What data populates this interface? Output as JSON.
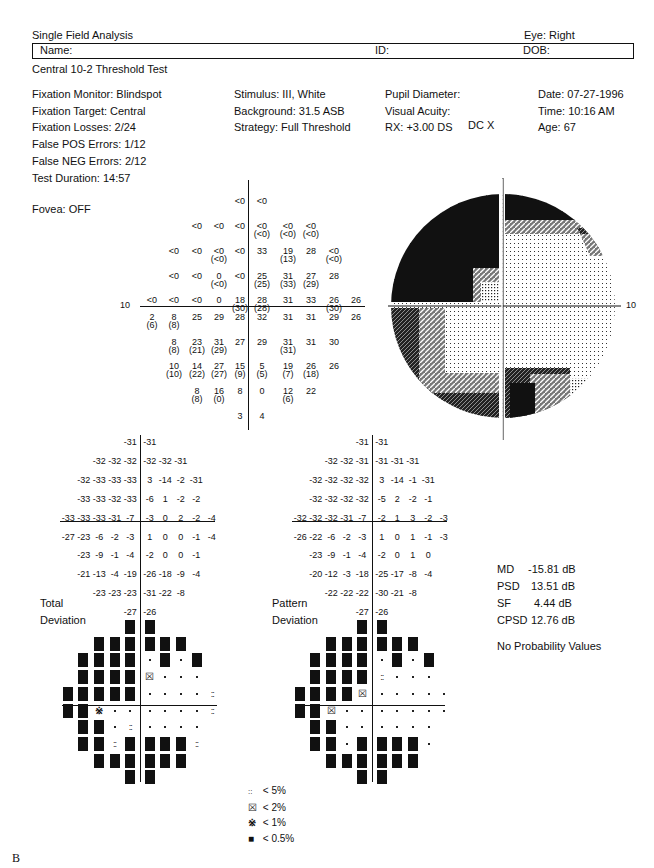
{
  "header": {
    "title": "Single Field Analysis",
    "eye": "Eye: Right",
    "name_label": "Name:",
    "id_label": "ID:",
    "dob_label": "DOB:",
    "test_name": "Central 10-2 Threshold Test"
  },
  "info": {
    "col1": [
      "Fixation Monitor: Blindspot",
      "Fixation Target: Central",
      "Fixation Losses: 2/24",
      "False POS Errors: 1/12",
      "False NEG Errors: 2/12",
      "Test Duration: 14:57"
    ],
    "fovea": "Fovea: OFF",
    "col2": [
      "Stimulus: III, White",
      "Background: 31.5 ASB",
      "Strategy: Full Threshold"
    ],
    "col3": [
      "Pupil Diameter:",
      "Visual Acuity:",
      "RX: +3.00 DS"
    ],
    "dc": "DC  X",
    "col4": [
      "Date: 07-27-1996",
      "Time: 10:16 AM",
      "Age: 67"
    ]
  },
  "axis_label": "10",
  "chart_data": [
    {
      "type": "table",
      "title": "Threshold values (dB), repeat in parentheses",
      "grid_columns": [
        -5,
        -4,
        -3,
        -2,
        -1,
        0,
        1,
        2,
        3,
        4
      ],
      "rows": [
        {
          "row": 1,
          "cells": [
            {
              "c": -1,
              "v": "<0"
            },
            {
              "c": 0,
              "v": "<0"
            }
          ]
        },
        {
          "row": 2,
          "cells": [
            {
              "c": -3,
              "v": "<0"
            },
            {
              "c": -2,
              "v": "<0"
            },
            {
              "c": -1,
              "v": "<0"
            },
            {
              "c": 0,
              "v": "<0",
              "r": "(<0)"
            },
            {
              "c": 1,
              "v": "<0",
              "r": "(<0)"
            },
            {
              "c": 2,
              "v": "<0",
              "r": "(<0)"
            }
          ]
        },
        {
          "row": 3,
          "cells": [
            {
              "c": -4,
              "v": "<0"
            },
            {
              "c": -3,
              "v": "<0"
            },
            {
              "c": -2,
              "v": "<0",
              "r": "(<0)"
            },
            {
              "c": -1,
              "v": "<0"
            },
            {
              "c": 0,
              "v": "33"
            },
            {
              "c": 1,
              "v": "19",
              "r": "(13)"
            },
            {
              "c": 2,
              "v": "28"
            },
            {
              "c": 3,
              "v": "<0",
              "r": "(<0)"
            }
          ]
        },
        {
          "row": 4,
          "cells": [
            {
              "c": -4,
              "v": "<0"
            },
            {
              "c": -3,
              "v": "<0"
            },
            {
              "c": -2,
              "v": "0",
              "r": "(<0)"
            },
            {
              "c": -1,
              "v": "<0"
            },
            {
              "c": 0,
              "v": "25",
              "r": "(25)"
            },
            {
              "c": 1,
              "v": "31",
              "r": "(33)"
            },
            {
              "c": 2,
              "v": "27",
              "r": "(29)"
            },
            {
              "c": 3,
              "v": "28"
            }
          ]
        },
        {
          "row": 5,
          "cells": [
            {
              "c": -5,
              "v": "<0"
            },
            {
              "c": -4,
              "v": "<0"
            },
            {
              "c": -3,
              "v": "<0"
            },
            {
              "c": -2,
              "v": "0"
            },
            {
              "c": -1,
              "v": "18",
              "r": "(30)"
            },
            {
              "c": 0,
              "v": "28",
              "r": "(28)"
            },
            {
              "c": 1,
              "v": "31"
            },
            {
              "c": 2,
              "v": "33"
            },
            {
              "c": 3,
              "v": "26",
              "r": "(30)"
            },
            {
              "c": 4,
              "v": "26"
            }
          ]
        },
        {
          "row": 6,
          "cells": [
            {
              "c": -5,
              "v": "2",
              "r": "(6)"
            },
            {
              "c": -4,
              "v": "8",
              "r": "(8)"
            },
            {
              "c": -3,
              "v": "25"
            },
            {
              "c": -2,
              "v": "29"
            },
            {
              "c": -1,
              "v": "28"
            },
            {
              "c": 0,
              "v": "32"
            },
            {
              "c": 1,
              "v": "31"
            },
            {
              "c": 2,
              "v": "31"
            },
            {
              "c": 3,
              "v": "29"
            },
            {
              "c": 4,
              "v": "26"
            }
          ]
        },
        {
          "row": 7,
          "cells": [
            {
              "c": -4,
              "v": "8",
              "r": "(8)"
            },
            {
              "c": -3,
              "v": "23",
              "r": "(21)"
            },
            {
              "c": -2,
              "v": "31",
              "r": "(29)"
            },
            {
              "c": -1,
              "v": "27"
            },
            {
              "c": 0,
              "v": "29"
            },
            {
              "c": 1,
              "v": "31",
              "r": "(31)"
            },
            {
              "c": 2,
              "v": "31"
            },
            {
              "c": 3,
              "v": "30"
            }
          ]
        },
        {
          "row": 8,
          "cells": [
            {
              "c": -4,
              "v": "10",
              "r": "(10)"
            },
            {
              "c": -3,
              "v": "14",
              "r": "(22)"
            },
            {
              "c": -2,
              "v": "27",
              "r": "(27)"
            },
            {
              "c": -1,
              "v": "15",
              "r": "(9)"
            },
            {
              "c": 0,
              "v": "5",
              "r": "(5)"
            },
            {
              "c": 1,
              "v": "19",
              "r": "(7)"
            },
            {
              "c": 2,
              "v": "26",
              "r": "(18)"
            },
            {
              "c": 3,
              "v": "26"
            }
          ]
        },
        {
          "row": 9,
          "cells": [
            {
              "c": -3,
              "v": "8",
              "r": "(8)"
            },
            {
              "c": -2,
              "v": "16",
              "r": "(0)"
            },
            {
              "c": -1,
              "v": "8"
            },
            {
              "c": 0,
              "v": "0"
            },
            {
              "c": 1,
              "v": "12",
              "r": "(6)"
            },
            {
              "c": 2,
              "v": "22"
            }
          ]
        },
        {
          "row": 10,
          "cells": [
            {
              "c": -1,
              "v": "3"
            },
            {
              "c": 0,
              "v": "4"
            }
          ]
        }
      ]
    },
    {
      "type": "table",
      "title": "Total Deviation (dB)",
      "rows": [
        [
          "-31",
          "-31"
        ],
        [
          "-32",
          "-32",
          "-32",
          "-32",
          "-32",
          "-31"
        ],
        [
          "-32",
          "-33",
          "-33",
          "-33",
          "3",
          "-14",
          "-2",
          "-31"
        ],
        [
          "-33",
          "-33",
          "-32",
          "-33",
          "-6",
          "1",
          "-2",
          "-2"
        ],
        [
          "-33",
          "-33",
          "-33",
          "-31",
          "-7",
          "-3",
          "0",
          "2",
          "-2",
          "-4"
        ],
        [
          "-27",
          "-23",
          "-6",
          "-2",
          "-3",
          "1",
          "0",
          "0",
          "-1",
          "-4"
        ],
        [
          "-23",
          "-9",
          "-1",
          "-4",
          "-2",
          "0",
          "0",
          "-1"
        ],
        [
          "-21",
          "-13",
          "-4",
          "-19",
          "-26",
          "-18",
          "-9",
          "-4"
        ],
        [
          "-23",
          "-23",
          "-23",
          "-31",
          "-22",
          "-8"
        ],
        [
          "-27",
          "-26"
        ]
      ]
    },
    {
      "type": "table",
      "title": "Pattern Deviation (dB)",
      "rows": [
        [
          "-31",
          "-31"
        ],
        [
          "-32",
          "-32",
          "-31",
          "-31",
          "-31",
          "-31"
        ],
        [
          "-32",
          "-32",
          "-32",
          "-32",
          "3",
          "-14",
          "-1",
          "-31"
        ],
        [
          "-32",
          "-32",
          "-32",
          "-32",
          "-5",
          "2",
          "-2",
          "-1"
        ],
        [
          "-32",
          "-32",
          "-32",
          "-31",
          "-7",
          "-2",
          "1",
          "3",
          "-2",
          "-3"
        ],
        [
          "-26",
          "-22",
          "-6",
          "-2",
          "-3",
          "1",
          "0",
          "1",
          "-1",
          "-3"
        ],
        [
          "-23",
          "-9",
          "-1",
          "-4",
          "-2",
          "0",
          "1",
          "0"
        ],
        [
          "-20",
          "-12",
          "-3",
          "-18",
          "-25",
          "-17",
          "-8",
          "-4"
        ],
        [
          "-22",
          "-22",
          "-22",
          "-30",
          "-21",
          "-8"
        ],
        [
          "-27",
          "-26"
        ]
      ]
    },
    {
      "type": "heatmap",
      "title": "Total Deviation probability map",
      "legend": {
        "dot": "normal",
        "p5": "< 5%",
        "p2": "< 2%",
        "p1": "< 1%",
        "p05": "< 0.5%"
      },
      "rows": [
        [
          "p05",
          "p05"
        ],
        [
          "p05",
          "p05",
          "p05",
          "p05",
          "p05",
          "p05"
        ],
        [
          "p05",
          "p05",
          "p05",
          "p05",
          "dot",
          "p05",
          "dot",
          "p05"
        ],
        [
          "p05",
          "p05",
          "p05",
          "p05",
          "p2",
          "dot",
          "dot",
          "dot"
        ],
        [
          "p05",
          "p05",
          "p05",
          "p05",
          "p05",
          "dot",
          "dot",
          "dot",
          "dot",
          "p5"
        ],
        [
          "p05",
          "p05",
          "p1",
          "dot",
          "dot",
          "dot",
          "dot",
          "dot",
          "dot",
          "p5"
        ],
        [
          "p05",
          "p05",
          "dot",
          "p5",
          "dot",
          "dot",
          "dot",
          "dot"
        ],
        [
          "p05",
          "p05",
          "p5",
          "p05",
          "p05",
          "p05",
          "p05",
          "p5"
        ],
        [
          "p05",
          "p05",
          "p05",
          "p05",
          "p05",
          "p05"
        ],
        [
          "p05",
          "p05"
        ]
      ]
    },
    {
      "type": "heatmap",
      "title": "Pattern Deviation probability map",
      "rows": [
        [
          "p05",
          "p05"
        ],
        [
          "p05",
          "p05",
          "p05",
          "p05",
          "p05",
          "p05"
        ],
        [
          "p05",
          "p05",
          "p05",
          "p05",
          "dot",
          "p05",
          "dot",
          "p05"
        ],
        [
          "p05",
          "p05",
          "p05",
          "p05",
          "p5",
          "dot",
          "dot",
          "dot"
        ],
        [
          "p05",
          "p05",
          "p05",
          "p05",
          "p2",
          "dot",
          "dot",
          "dot",
          "dot",
          "dot"
        ],
        [
          "p05",
          "p05",
          "p2",
          "dot",
          "dot",
          "dot",
          "dot",
          "dot",
          "dot",
          "dot"
        ],
        [
          "p05",
          "p05",
          "dot",
          "dot",
          "dot",
          "dot",
          "dot",
          "dot"
        ],
        [
          "p05",
          "p05",
          "dot",
          "p05",
          "p05",
          "p05",
          "p05",
          "dot"
        ],
        [
          "p05",
          "p05",
          "p05",
          "p05",
          "p05",
          "p05"
        ],
        [
          "p05",
          "p05"
        ]
      ]
    }
  ],
  "labels": {
    "total_1": "Total",
    "total_2": "Deviation",
    "pattern_1": "Pattern",
    "pattern_2": "Deviation"
  },
  "indices": {
    "md_label": "MD",
    "md_value": "-15.81 dB",
    "psd_label": "PSD",
    "psd_value": "13.51 dB",
    "sf_label": "SF",
    "sf_value": "4.44 dB",
    "cpsd_label": "CPSD",
    "cpsd_value": "12.76 dB",
    "note": "No Probability Values"
  },
  "legend": [
    {
      "symbol": "::",
      "label": "< 5%"
    },
    {
      "symbol": "☒",
      "label": "< 2%"
    },
    {
      "symbol": "※",
      "label": "< 1%"
    },
    {
      "symbol": "■",
      "label": "< 0.5%"
    }
  ],
  "figure_label": "B"
}
